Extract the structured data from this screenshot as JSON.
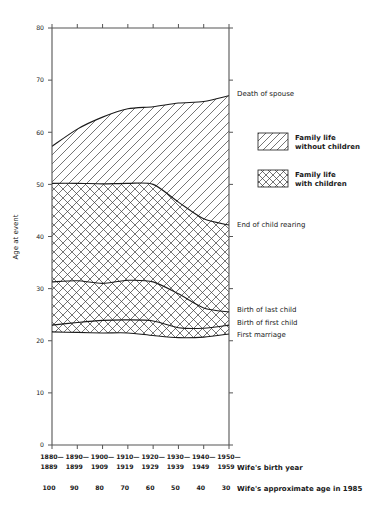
{
  "chart_data": {
    "type": "area",
    "title": "",
    "subtitle": "",
    "ylabel": "Age at event",
    "xlabel": "Wife's birth year",
    "xlabel2": "Wife's approximate age in 1985",
    "ylim": [
      0,
      80
    ],
    "yticks": [
      0,
      10,
      20,
      30,
      40,
      50,
      60,
      70,
      80
    ],
    "ytick_labels": [
      "0",
      "10",
      "20",
      "30",
      "40",
      "50",
      "60",
      "70",
      "80"
    ],
    "grid": false,
    "legend_position": "right",
    "categories": [
      "1880-\n1889",
      "1890-\n1899",
      "1900-\n1909",
      "1910-\n1919",
      "1920-\n1929",
      "1930-\n1939",
      "1940-\n1949",
      "1950-\n1959"
    ],
    "xtick_labels_top": [
      "1880—",
      "1890—",
      "1900—",
      "1910—",
      "1920—",
      "1930—",
      "1940—",
      "1950—"
    ],
    "xtick_labels_bottom": [
      "1889",
      "1899",
      "1909",
      "1919",
      "1929",
      "1939",
      "1949",
      "1959"
    ],
    "xtick_labels_age": [
      "100",
      "90",
      "80",
      "70",
      "60",
      "50",
      "40",
      "30"
    ],
    "series": [
      {
        "name": "Death of spouse",
        "label_right": "Death of spouse",
        "values": [
          57.3,
          60.6,
          62.9,
          64.5,
          64.9,
          65.6,
          65.9,
          67.0
        ]
      },
      {
        "name": "End of child rearing",
        "label_right": "End of child rearing",
        "values": [
          50.2,
          50.2,
          50.1,
          50.2,
          50.0,
          46.6,
          43.4,
          42.2
        ]
      },
      {
        "name": "Birth of last child",
        "label_right": "Birth of last child",
        "values": [
          31.3,
          31.5,
          31.0,
          31.6,
          31.3,
          29.0,
          26.3,
          25.5
        ]
      },
      {
        "name": "Birth of first child",
        "label_right": "Birth of first child",
        "values": [
          23.0,
          23.5,
          23.9,
          24.0,
          23.8,
          22.5,
          22.4,
          23.0
        ]
      },
      {
        "name": "First marriage",
        "label_right": "First marriage",
        "values": [
          21.7,
          21.6,
          21.5,
          21.5,
          21.0,
          20.6,
          20.7,
          21.3
        ]
      }
    ],
    "bands": [
      {
        "name": "Family life without children",
        "upper": "Death of spouse",
        "lower": "End of child rearing",
        "pattern": "diagonal-hatch"
      },
      {
        "name": "Family life with children",
        "upper": "End of child rearing",
        "lower": "First marriage",
        "pattern": "cross-hatch"
      }
    ]
  },
  "legend": {
    "items": [
      {
        "pattern": "diagonal-hatch",
        "line1": "Family life",
        "line2": "without children"
      },
      {
        "pattern": "cross-hatch",
        "line1": "Family life",
        "line2": "with children"
      }
    ]
  },
  "colors": {
    "ink": "#1a1a1a",
    "axis": "#555555",
    "hatch": "#3a3a3a",
    "background": "#ffffff"
  }
}
